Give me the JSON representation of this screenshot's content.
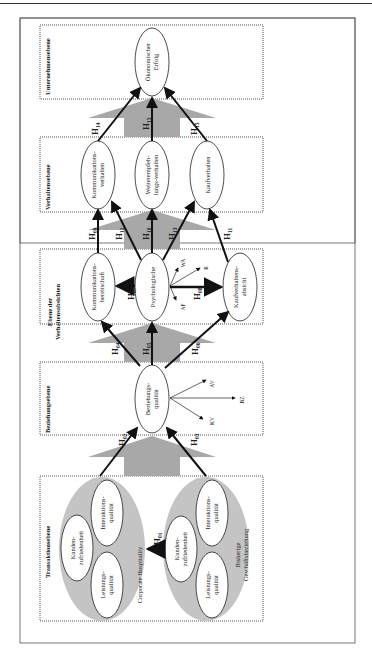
{
  "colors": {
    "frame": "#555555",
    "dotted_border": "#444444",
    "gray_fill": "#a8a8a8",
    "light_gray_fill": "#c4c4c4",
    "arrow": "#111111"
  },
  "levels": {
    "transaction": "Transaktionsebene",
    "relationship": "Beziehungsebene",
    "intention": "Ebene der Verhaltensabsichten",
    "intention_line1": "Ebene der",
    "intention_line2": "Verhaltensabsichten",
    "behavior": "Verhaltensebene",
    "company": "Unternehmensebene"
  },
  "groups": {
    "corporate_hospitality": "Corporate Hospitality",
    "existing_business_line1": "Bisherige",
    "existing_business_line2": "Geschäftsbeziehung"
  },
  "nodes": {
    "ch_kundenzufriedenheit_1": "Kunden-",
    "ch_kundenzufriedenheit_2": "zufriedenheit",
    "ch_interaktionsqualitaet_1": "Interaktions-",
    "ch_interaktionsqualitaet_2": "qualität",
    "ch_leistungsqualitaet_1": "Leistungs-",
    "ch_leistungsqualitaet_2": "qualität",
    "gb_kundenzufriedenheit_1": "Kunden-",
    "gb_kundenzufriedenheit_2": "zufriedenheit",
    "gb_interaktionsqualitaet_1": "Interaktions-",
    "gb_interaktionsqualitaet_2": "qualität",
    "gb_leistungsqualitaet_1": "Leistungs-",
    "gb_leistungsqualitaet_2": "qualität",
    "beziehungsqualitaet_1": "Beziehungs-",
    "beziehungsqualitaet_2": "qualität",
    "kommunikationsbereitschaft_1": "Kommunikations-",
    "kommunikationsbereitschaft_2": "bereitschaft",
    "psychologische": "Psychologische",
    "kaufverhaltensabsicht_1": "Kaufverhaltens-",
    "kaufverhaltensabsicht_2": "absicht",
    "kommunikationsverhalten_1": "Kommunikations-",
    "kommunikationsverhalten_2": "verhalten",
    "weiterempfehlungsverhalten_1": "Weiterempfeh-",
    "weiterempfehlungsverhalten_2": "lungs-verhalten",
    "kaufverhalten": "Kaufverhalten",
    "oekonomischer_erfolg_1": "Ökonomischer",
    "oekonomischer_erfolg_2": "Erfolg"
  },
  "dimensions": {
    "relationship": [
      "AV",
      "BZ",
      "KV"
    ],
    "psychological": [
      "WA",
      "R",
      "AF"
    ]
  },
  "hypotheses": {
    "h01": {
      "main": "H",
      "sub": "01"
    },
    "h02": {
      "main": "H",
      "sub": "02"
    },
    "h03": {
      "main": "H",
      "sub": "03"
    },
    "h04": {
      "main": "H",
      "sub": "04"
    },
    "h05": {
      "main": "H",
      "sub": "05"
    },
    "h06": {
      "main": "H",
      "sub": "06"
    },
    "h07": {
      "main": "H",
      "sub": "07"
    },
    "h08": {
      "main": "H",
      "sub": "08"
    },
    "h09": {
      "main": "H",
      "sub": "09"
    },
    "h10": {
      "main": "H",
      "sub": "10"
    },
    "h11": {
      "main": "H",
      "sub": "11"
    },
    "h12": {
      "main": "H",
      "sub": "12"
    },
    "h13": {
      "main": "H",
      "sub": "13"
    },
    "h14": {
      "main": "H",
      "sub": "14"
    },
    "h15": {
      "main": "H",
      "sub": "15"
    }
  }
}
